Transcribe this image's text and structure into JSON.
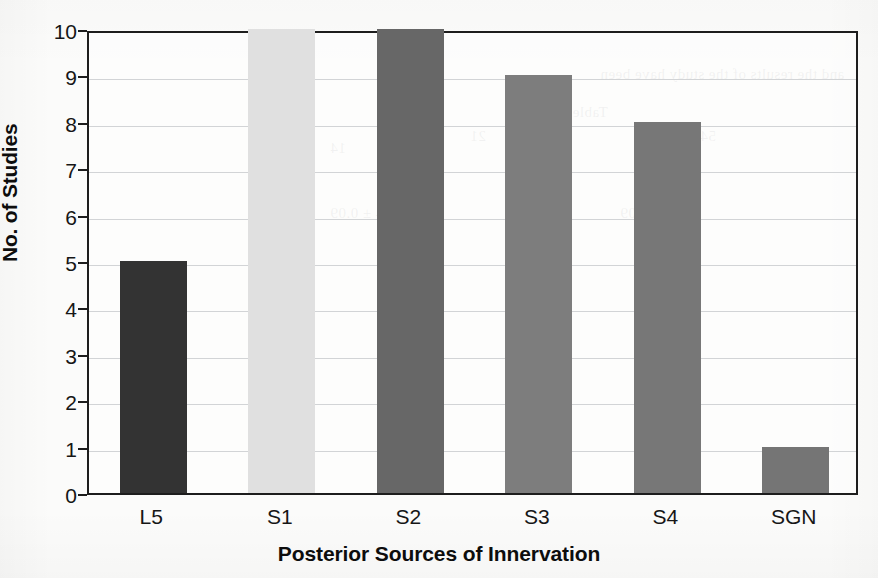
{
  "chart_data": {
    "type": "bar",
    "title": "",
    "categories": [
      "L5",
      "S1",
      "S2",
      "S3",
      "S4",
      "SGN"
    ],
    "values": [
      5,
      10,
      10,
      9,
      8,
      1
    ],
    "xlabel": "Posterior Sources of Innervation",
    "ylabel": "No. of Studies",
    "ylim": [
      0,
      10
    ],
    "yticks": [
      0,
      1,
      2,
      3,
      4,
      5,
      6,
      7,
      8,
      9,
      10
    ],
    "ytick_labels": [
      "0",
      "1",
      "2",
      "3",
      "4",
      "5",
      "6",
      "7",
      "8",
      "9",
      "10"
    ],
    "grid": true,
    "grid_axis": "y",
    "legend": false,
    "legend_position": "none",
    "bar_colors": [
      "#333333",
      "#e0e0e0",
      "#676767",
      "#7d7d7d",
      "#777777",
      "#757575"
    ],
    "series": [
      {
        "name": "No. of Studies",
        "values": [
          5,
          10,
          10,
          9,
          8,
          1
        ]
      }
    ]
  },
  "axes": {
    "y_title": "No. of Studies",
    "x_title": "Posterior Sources of Innervation",
    "frame_color": "#1d1d1d",
    "gridline_color": "#d2d4d6"
  },
  "page": {
    "background_color": "#fbfbfa",
    "bleed_text": [
      "and the results of the study have been",
      "Table 2",
      "54",
      "21",
      "14",
      "0.58 ± 0.09",
      "0.44 ± 0.09"
    ]
  }
}
